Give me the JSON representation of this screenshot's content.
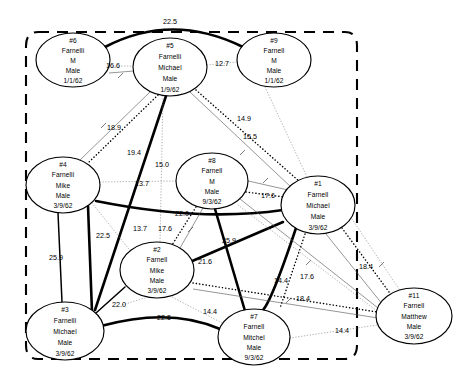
{
  "diagram": {
    "boundary": {
      "name": "cluster-boundary",
      "style": "dashed-rounded-rect"
    },
    "nodes": [
      {
        "id": "6",
        "label_id": "#6",
        "surname": "Farnelli",
        "given": "M",
        "sex": "Male",
        "dob": "1/1/62",
        "cx": 73,
        "cy": 60,
        "rx": 37,
        "ry": 27
      },
      {
        "id": "5",
        "label_id": "#5",
        "surname": "Farnelli",
        "given": "Michael",
        "sex": "Male",
        "dob": "1/9/62",
        "cx": 170,
        "cy": 67,
        "rx": 37,
        "ry": 29
      },
      {
        "id": "9",
        "label_id": "#9",
        "surname": "Farnell",
        "given": "M",
        "sex": "Male",
        "dob": "1/1/62",
        "cx": 274,
        "cy": 60,
        "rx": 37,
        "ry": 27
      },
      {
        "id": "4",
        "label_id": "#4",
        "surname": "Farnelli",
        "given": "Mike",
        "sex": "Male",
        "dob": "3/9/62",
        "cx": 63,
        "cy": 185,
        "rx": 37,
        "ry": 28
      },
      {
        "id": "8",
        "label_id": "#8",
        "surname": "Farnell",
        "given": "M",
        "sex": "Male",
        "dob": "9/3/62",
        "cx": 212,
        "cy": 181,
        "rx": 36,
        "ry": 28
      },
      {
        "id": "1",
        "label_id": "#1",
        "surname": "Farnell",
        "given": "Michael",
        "sex": "Male",
        "dob": "3/9/62",
        "cx": 318,
        "cy": 205,
        "rx": 37,
        "ry": 29
      },
      {
        "id": "2",
        "label_id": "#2",
        "surname": "Farnell",
        "given": "Mike",
        "sex": "Male",
        "dob": "3/9/62",
        "cx": 157,
        "cy": 270,
        "rx": 37,
        "ry": 28
      },
      {
        "id": "3",
        "label_id": "#3",
        "surname": "Farnelli",
        "given": "Michael",
        "sex": "Male",
        "dob": "3/9/62",
        "cx": 65,
        "cy": 331,
        "rx": 39,
        "ry": 29
      },
      {
        "id": "7",
        "label_id": "#7",
        "surname": "Farnell",
        "given": "Mitchel",
        "sex": "Male",
        "dob": "9/3/62",
        "cx": 254,
        "cy": 337,
        "rx": 36,
        "ry": 28
      },
      {
        "id": "11",
        "label_id": "#11",
        "surname": "Farnell",
        "given": "Matthew",
        "sex": "Male",
        "dob": "3/9/62",
        "cx": 414,
        "cy": 316,
        "rx": 38,
        "ry": 28
      }
    ],
    "edges": [
      {
        "from": "6",
        "to": "9",
        "weight": "22.5",
        "style": "thick",
        "lx": 170,
        "ly": 22
      },
      {
        "from": "6",
        "to": "5",
        "weight": "16.6",
        "style": "dotted-fine",
        "lx": 113,
        "ly": 68
      },
      {
        "from": "5",
        "to": "9",
        "weight": "12.7",
        "style": "dotted-fine",
        "lx": 222,
        "ly": 67
      },
      {
        "from": "5",
        "to": "4",
        "weight": "18.9",
        "style": "thin",
        "lx": 114,
        "ly": 128
      },
      {
        "from": "5",
        "to": "3",
        "weight": "19.4",
        "style": "thick",
        "lx": 134,
        "ly": 153
      },
      {
        "from": "5",
        "to": "2",
        "weight": "15.0",
        "style": "dotted-fine",
        "lx": 160,
        "ly": 165
      },
      {
        "from": "5",
        "to": "1",
        "weight": "15.5",
        "style": "thin",
        "lx": 246,
        "ly": 137
      },
      {
        "from": "9",
        "to": "1",
        "weight": "14.9",
        "style": "dotted-fine",
        "lx": 242,
        "ly": 118
      },
      {
        "from": "4",
        "to": "8",
        "weight": "13.7",
        "style": "dotted-fine",
        "lx": 143,
        "ly": 184
      },
      {
        "from": "4",
        "to": "1",
        "weight": "22.0",
        "style": "thick",
        "lx": 182,
        "ly": 214
      },
      {
        "from": "4",
        "to": "2",
        "weight": "13.7",
        "style": "dotted-fine",
        "lx": 123,
        "ly": 229
      },
      {
        "from": "4",
        "to": "3",
        "weight": "25.9",
        "style": "medium",
        "lx": 55,
        "ly": 258
      },
      {
        "from": "4",
        "to": "3b",
        "weight": "22.5",
        "style": "thick",
        "lx": 102,
        "ly": 237
      },
      {
        "from": "8",
        "to": "1",
        "weight": "17.6",
        "style": "dotted-bold",
        "lx": 266,
        "ly": 196
      },
      {
        "from": "8",
        "to": "2",
        "weight": "17.6",
        "style": "dotted-bold",
        "lx": 164,
        "ly": 229
      },
      {
        "from": "8",
        "to": "7",
        "weight": "21.6",
        "style": "thick",
        "lx": 206,
        "ly": 262
      },
      {
        "from": "1",
        "to": "2",
        "weight": "25.9",
        "style": "thick",
        "lx": 227,
        "ly": 241
      },
      {
        "from": "1",
        "to": "7",
        "weight": "14.4",
        "style": "dotted-bold",
        "lx": 281,
        "ly": 280
      },
      {
        "from": "1",
        "to": "11",
        "weight": "17.6",
        "style": "thin",
        "lx": 305,
        "ly": 277
      },
      {
        "from": "1",
        "to": "11b",
        "weight": "18.4",
        "style": "dotted-bold",
        "lx": 366,
        "ly": 267
      },
      {
        "from": "2",
        "to": "11",
        "weight": "18.4",
        "style": "dotted-bold",
        "lx": 301,
        "ly": 299
      },
      {
        "from": "2",
        "to": "3",
        "weight": "22.0",
        "style": "medium",
        "lx": 118,
        "ly": 305
      },
      {
        "from": "3",
        "to": "7",
        "weight": "22.5",
        "style": "thick",
        "lx": 163,
        "ly": 318
      },
      {
        "from": "2",
        "to": "7",
        "weight": "14.4",
        "style": "dotted-fine",
        "lx": 211,
        "ly": 312
      },
      {
        "from": "7",
        "to": "11",
        "weight": "14.4",
        "style": "dotted-fine",
        "lx": 341,
        "ly": 330
      }
    ]
  }
}
